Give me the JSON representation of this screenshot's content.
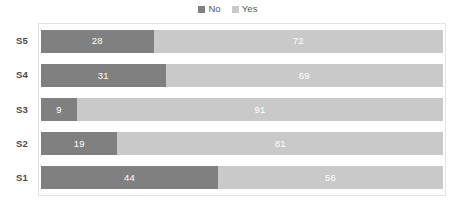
{
  "chart_data": {
    "type": "bar",
    "orientation": "horizontal",
    "stacked": true,
    "normalized_percent": true,
    "title": "",
    "subtitle": "",
    "xlabel": "",
    "ylabel": "",
    "xlim": [
      0,
      100
    ],
    "grid": false,
    "legend_position": "top-center",
    "categories": [
      "S5",
      "S4",
      "S3",
      "S2",
      "S1"
    ],
    "series": [
      {
        "name": "No",
        "color": "#808080",
        "values": [
          28,
          31,
          9,
          19,
          44
        ]
      },
      {
        "name": "Yes",
        "color": "#c9c9c9",
        "values": [
          72,
          69,
          91,
          81,
          56
        ]
      }
    ],
    "data_labels": [
      {
        "category": "S5",
        "no": "28",
        "yes": "72"
      },
      {
        "category": "S4",
        "no": "31",
        "yes": "69"
      },
      {
        "category": "S3",
        "no": "9",
        "yes": "91"
      },
      {
        "category": "S2",
        "no": "19",
        "yes": "81"
      },
      {
        "category": "S1",
        "no": "44",
        "yes": "56"
      }
    ]
  },
  "legend": {
    "entries": [
      {
        "label": "No",
        "color": "#808080",
        "marker": "square-marker-icon"
      },
      {
        "label": "Yes",
        "color": "#c9c9c9",
        "marker": "square-marker-icon"
      }
    ]
  },
  "colors": {
    "series_no": "#808080",
    "series_yes": "#c9c9c9",
    "plot_border": "#e4e4e4",
    "label_text": "#4a4a4a",
    "legend_text": "#5a5a5a",
    "value_text": "#ffffff",
    "background": "#ffffff"
  }
}
